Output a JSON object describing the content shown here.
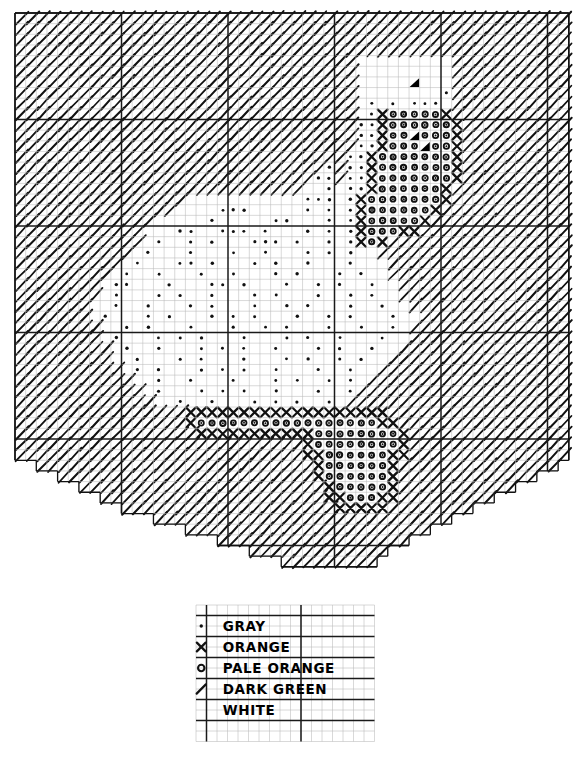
{
  "document": {
    "kind": "cross-stitch-pattern-chart",
    "title": "Swan Cross Stitch Pattern"
  },
  "grid": {
    "columns": 52,
    "rows": 52,
    "cell_size_px": 10.65,
    "origin_x_px": 15,
    "origin_y_px": 13,
    "minor_line_color": "#b9b9b9",
    "major_line_color": "#1a1a1a",
    "major_line_every": 10
  },
  "symbols": {
    "gray": {
      "glyph": "dot",
      "label": "GRAY"
    },
    "orange": {
      "glyph": "cross",
      "label": "ORANGE"
    },
    "pale_orange": {
      "glyph": "circle",
      "label": "PALE ORANGE"
    },
    "dark_green": {
      "glyph": "slash",
      "label": "DARK GREEN"
    },
    "white": {
      "glyph": "blank",
      "label": "WHITE"
    },
    "black": {
      "glyph": "triangle",
      "label": "BLACK"
    }
  },
  "legend": {
    "x_px": 196,
    "y_px": 605,
    "cell_size_px": 10.5,
    "columns": 17,
    "rows": 13,
    "rows_data": [
      {
        "symbol": "dot",
        "label": "GRAY"
      },
      {
        "symbol": "cross",
        "label": "ORANGE"
      },
      {
        "symbol": "circle",
        "label": "PALE ORANGE"
      },
      {
        "symbol": "slash",
        "label": "DARK GREEN"
      },
      {
        "symbol": "blank",
        "label": "WHITE"
      }
    ]
  },
  "chart_data": {
    "type": "heatmap",
    "xlabel": "",
    "ylabel": "",
    "legend_position": "bottom",
    "grid": true,
    "categories": [
      "GRAY",
      "ORANGE",
      "PALE ORANGE",
      "DARK GREEN",
      "WHITE"
    ],
    "palette": {
      "GRAY": "#9a9a9a",
      "ORANGE": "#e08a2e",
      "PALE ORANGE": "#f2c489",
      "DARK GREEN": "#1e5a32",
      "WHITE": "#ffffff",
      "BLACK": "#000000"
    },
    "width": 52,
    "height": 52,
    "legend_codes": {
      "g": "DARK GREEN",
      "w": "WHITE",
      ".": "GRAY",
      "x": "ORANGE",
      "o": "PALE ORANGE",
      "b": "BLACK",
      " ": "EMPTY"
    },
    "rows": [
      "gggggggggggggggggggggggggggggggggggggggggggggggggggg",
      "gggggggggggggggggggggggggggggggggggggggggggggggggggg",
      "gggggggggggggggggggggggggggggggggggggggggggggggggggg",
      "gggggggggggggggggggggggggggggggggggggggggggggggggggg",
      "ggggggggggggggggggggggggggggggggwwwwwwwwwgggggggggggg",
      "ggggggggggggggggggggggggggggggggwwwwwwwwwgggggggggggg",
      "ggggggggggggggggggggggggggggggggwwwwwbwwwgggggggggggg",
      "ggggggggggggggggggggggggggggggggwwwwwwww.ggggggggggggg",
      "ggggggggggggggggggggggggggggggggw.w.w...wgggggggggggg",
      "ggggggggggggggggggggggggggggggggw.xoooooxggggggggggggg",
      "gggggggggggggggggggggggggggggggg..xooooooxgggggggggggg",
      "gggggggggggggggggggggggggggggggg..xooboooxgggggggggggg",
      "gggggggggggggggggggggggggggggggg..xooobooxgggggggggggg",
      "ggggggggggggggggggggggggggggggg..xoooooooxggggggggggggg",
      "ggggggggggggggggggggggggggggg.g..xoooooooxgggggggggggg",
      "gggggggggggggggggggggggggggg..g..xoooooooxgggggggggggg",
      "gggggggggggggggggggggggggggww.w..xooooooxggggggggggggg",
      "ggggggggggggggggwwwwwwwwwww...w.xoooooooxgggggggggggg",
      "gggggggggggggggwwww...wwwww.w.w.xooooooxgggggggggggggg",
      "gggggggggggggwwwww.wwwww..www.w.xoooooxggggggggggggggg",
      "ggggggggggggwww..ww...w.www.w.w.xoooxxggggggggggggggggg",
      "ggggggggggggw.ww.w.www...w.ww.w.xoxggggggggggggggggggg",
      "gggggggggggw.www.www.ww.www.w.w.wwgggggggggggggggggggg",
      "ggggggggggw.www..w.www.w.ww.www.wwwgggggggggggggggggggg",
      "gggggggggw.ww.www.ww.www.w.www.w.wwggggggggggggggggggg",
      "ggggggggw..www.www..w.www.ww.w.ww.wwgggggggggggggggggg",
      "ggggggggw.www.w.ww.www.w.www.ww.w.wwggggggggggggggggg",
      "gggggggww.ww.www.w.www.ww.w.www.ww.wwgggggggggggggggg",
      "gggggggw.www.w.www.w.w.www.ww.w.www.wwggggggggggggggg",
      "ggggggggww.w.www.www.ww.w.www.ww.ww.wgggggggggggggggg",
      "ggggggggw.www.w.w.www.www.w.ww.www.wwggggggggggggggggg",
      "gggggggggw.ww.www.w.w.ww.www.w.ww.wwgggggggggggggggggg",
      "gggggggggww.www.w.www.www.w.ww.w.wwggggggggggggggggggg",
      "ggggggggggw.w.www.w.w.ww.www.ww.wwgggggggggggggggggggg",
      "gggggggggggww.ww.www.www.w.ww.w.wggggggggggggggggggggg",
      "ggggggggggggw.www.w.w.ww.www.ww.gggggggggggggggggggggg",
      "gggggggggggggww.ww.www.w.w.ww.wggggggggggggggggggggggg",
      "ggggggggggggggggxxxxxxxxxxxxxxxxxxxggggggggggggggggggg",
      "ggggggggggggggggxoooooooooooooooooxxgggggggggggggggggg",
      "gggggggggggggggggxxxxxxxxxxxooooooooxggggggggggggggggg",
      "gggggggggggggggggggggggggggxooooooooxggggggggggggggggg",
      "gggggggggggggggggggggggggggxxooooooxxgggggggggggggggg",
      "ggggggggggggggggggggggggggggxooooooxggggggggggggggggg",
      "ggggggggggggggggggggggggggggxooooooxgggggggggggggggggg",
      "gggggggggggggggggggggggggggggxoooooxgggggggggggggggggg",
      "gggggggggggggggggggggggggggggxxoooxxgggggggggggggggggg",
      "ggggggggggggggggggggggggggggggxxxxxggggggggggggggggggg",
      "gggggggggggggggggggggggggggggggggggggggggggggggggggg",
      "gggggggggggggggggggggggggggggggggggggggggggggggggggg",
      "gggggggggggggggggggggggggggggggggggggggggggggggggggg",
      "gggggggggggggggggggggggggggggggggggggggggggggggggggg",
      "gggggggggggggggggggggggggggggggggggggggggggggggggggg"
    ],
    "outline_note": "Outer silhouette is a rounded bowl: full rectangle for top 40 rows, then a staircase taper on both lower corners."
  },
  "shape": {
    "comment": "Per-row [startCol,endCol] inclusive extents of the drawn chart area (0-indexed).",
    "row_extents": [
      [
        0,
        51
      ],
      [
        0,
        51
      ],
      [
        0,
        51
      ],
      [
        0,
        51
      ],
      [
        0,
        51
      ],
      [
        0,
        51
      ],
      [
        0,
        51
      ],
      [
        0,
        51
      ],
      [
        0,
        51
      ],
      [
        0,
        51
      ],
      [
        0,
        51
      ],
      [
        0,
        51
      ],
      [
        0,
        51
      ],
      [
        0,
        51
      ],
      [
        0,
        51
      ],
      [
        0,
        51
      ],
      [
        0,
        51
      ],
      [
        0,
        51
      ],
      [
        0,
        51
      ],
      [
        0,
        51
      ],
      [
        0,
        51
      ],
      [
        0,
        51
      ],
      [
        0,
        51
      ],
      [
        0,
        51
      ],
      [
        0,
        51
      ],
      [
        0,
        51
      ],
      [
        0,
        51
      ],
      [
        0,
        51
      ],
      [
        0,
        51
      ],
      [
        0,
        51
      ],
      [
        0,
        51
      ],
      [
        0,
        51
      ],
      [
        0,
        51
      ],
      [
        0,
        51
      ],
      [
        0,
        51
      ],
      [
        0,
        51
      ],
      [
        0,
        51
      ],
      [
        0,
        51
      ],
      [
        0,
        51
      ],
      [
        0,
        51
      ],
      [
        0,
        51
      ],
      [
        0,
        51
      ],
      [
        2,
        50
      ],
      [
        4,
        48
      ],
      [
        6,
        46
      ],
      [
        8,
        44
      ],
      [
        10,
        42
      ],
      [
        13,
        40
      ],
      [
        16,
        38
      ],
      [
        19,
        36
      ],
      [
        22,
        34
      ],
      [
        25,
        33
      ]
    ]
  },
  "cells": {
    "gray_dots": [
      [
        40,
        6
      ],
      [
        32,
        8
      ],
      [
        34,
        8
      ],
      [
        36,
        8
      ],
      [
        38,
        8
      ],
      [
        39,
        8
      ],
      [
        40,
        8
      ],
      [
        32,
        9
      ],
      [
        32,
        10
      ],
      [
        33,
        10
      ],
      [
        32,
        11
      ],
      [
        33,
        11
      ],
      [
        32,
        12
      ],
      [
        33,
        12
      ],
      [
        31,
        13
      ],
      [
        32,
        13
      ],
      [
        29,
        14
      ],
      [
        32,
        14
      ],
      [
        33,
        14
      ],
      [
        28,
        15
      ],
      [
        29,
        15
      ],
      [
        32,
        15
      ],
      [
        33,
        15
      ],
      [
        30,
        16
      ],
      [
        32,
        16
      ],
      [
        33,
        16
      ],
      [
        30,
        17
      ],
      [
        31,
        17
      ],
      [
        32,
        17
      ],
      [
        19,
        18
      ],
      [
        20,
        18
      ],
      [
        21,
        18
      ],
      [
        28,
        18
      ],
      [
        30,
        18
      ],
      [
        32,
        18
      ],
      [
        18,
        19
      ],
      [
        26,
        19
      ],
      [
        27,
        19
      ],
      [
        30,
        19
      ],
      [
        32,
        19
      ],
      [
        16,
        20
      ],
      [
        17,
        20
      ],
      [
        18,
        20
      ],
      [
        19,
        20
      ],
      [
        24,
        20
      ],
      [
        30,
        20
      ],
      [
        32,
        20
      ],
      [
        14,
        21
      ],
      [
        15,
        21
      ],
      [
        22,
        21
      ],
      [
        23,
        21
      ],
      [
        28,
        21
      ],
      [
        30,
        21
      ],
      [
        32,
        21
      ],
      [
        13,
        22
      ],
      [
        20,
        22
      ],
      [
        22,
        22
      ],
      [
        24,
        22
      ],
      [
        26,
        22
      ],
      [
        30,
        22
      ],
      [
        32,
        22
      ],
      [
        11,
        23
      ],
      [
        12,
        23
      ],
      [
        18,
        23
      ],
      [
        24,
        23
      ],
      [
        28,
        23
      ],
      [
        30,
        23
      ],
      [
        32,
        23
      ],
      [
        10,
        24
      ],
      [
        16,
        24
      ],
      [
        20,
        24
      ],
      [
        26,
        24
      ],
      [
        30,
        24
      ],
      [
        32,
        24
      ],
      [
        9,
        25
      ],
      [
        14,
        25
      ],
      [
        18,
        25
      ],
      [
        22,
        25
      ],
      [
        28,
        25
      ],
      [
        30,
        25
      ],
      [
        32,
        25
      ],
      [
        8,
        26
      ],
      [
        12,
        26
      ],
      [
        16,
        26
      ],
      [
        20,
        26
      ],
      [
        24,
        26
      ],
      [
        26,
        26
      ],
      [
        30,
        26
      ],
      [
        32,
        26
      ],
      [
        7,
        27
      ],
      [
        10,
        27
      ],
      [
        14,
        27
      ],
      [
        18,
        27
      ],
      [
        22,
        27
      ],
      [
        28,
        27
      ],
      [
        30,
        27
      ],
      [
        6,
        28
      ],
      [
        9,
        28
      ],
      [
        12,
        28
      ],
      [
        16,
        28
      ],
      [
        20,
        28
      ],
      [
        24,
        28
      ],
      [
        26,
        28
      ],
      [
        30,
        28
      ],
      [
        8,
        29
      ],
      [
        11,
        29
      ],
      [
        14,
        29
      ],
      [
        18,
        29
      ],
      [
        22,
        29
      ],
      [
        28,
        29
      ],
      [
        30,
        29
      ],
      [
        7,
        30
      ],
      [
        10,
        30
      ],
      [
        13,
        30
      ],
      [
        16,
        30
      ],
      [
        20,
        30
      ],
      [
        24,
        30
      ],
      [
        26,
        30
      ],
      [
        30,
        30
      ],
      [
        9,
        31
      ],
      [
        12,
        31
      ],
      [
        15,
        31
      ],
      [
        18,
        31
      ],
      [
        22,
        31
      ],
      [
        28,
        31
      ],
      [
        11,
        32
      ],
      [
        14,
        32
      ],
      [
        17,
        32
      ],
      [
        20,
        32
      ],
      [
        24,
        32
      ],
      [
        26,
        32
      ],
      [
        13,
        33
      ],
      [
        16,
        33
      ],
      [
        19,
        33
      ],
      [
        22,
        33
      ],
      [
        28,
        33
      ],
      [
        15,
        34
      ],
      [
        18,
        34
      ],
      [
        21,
        34
      ],
      [
        24,
        34
      ],
      [
        26,
        34
      ],
      [
        17,
        35
      ],
      [
        20,
        35
      ],
      [
        23,
        35
      ],
      [
        28,
        35
      ],
      [
        19,
        36
      ],
      [
        22,
        36
      ],
      [
        25,
        36
      ],
      [
        27,
        36
      ]
    ]
  }
}
